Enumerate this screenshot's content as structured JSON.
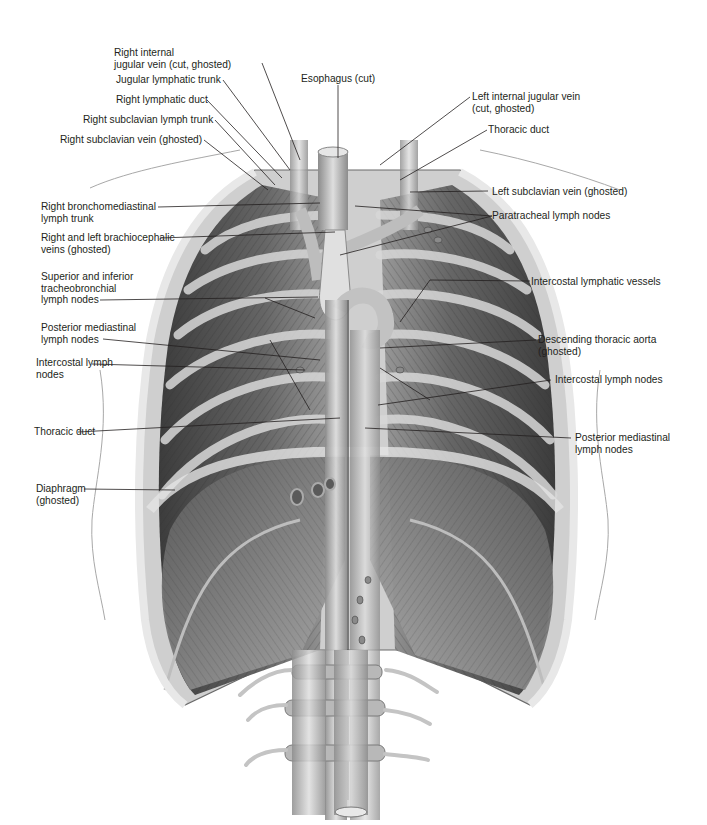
{
  "figure": {
    "colors": {
      "background": "#ffffff",
      "label_text": "#231f20",
      "leader_line": "#231f20",
      "tissue_dark": "#4a4a4a",
      "tissue_mid": "#8a8a8a",
      "tissue_light": "#cfcfcf",
      "outline": "#9a9a9a"
    }
  },
  "labels": {
    "left": [
      {
        "id": "rijv",
        "text": "Right internal\njugular vein (cut, ghosted)"
      },
      {
        "id": "jlt",
        "text": "Jugular lymphatic trunk"
      },
      {
        "id": "rld",
        "text": "Right lymphatic duct"
      },
      {
        "id": "rslt",
        "text": "Right subclavian lymph trunk"
      },
      {
        "id": "rsv",
        "text": "Right subclavian vein (ghosted)"
      },
      {
        "id": "rbmt",
        "text": "Right bronchomediastinal\nlymph trunk"
      },
      {
        "id": "rlbv",
        "text": "Right and left brachiocephalic\nveins (ghosted)"
      },
      {
        "id": "sitb",
        "text": "Superior and inferior\ntracheobronchial\nlymph nodes"
      },
      {
        "id": "pmln_l",
        "text": "Posterior mediastinal\nlymph nodes"
      },
      {
        "id": "icln_l",
        "text": "Intercostal lymph\nnodes"
      },
      {
        "id": "td_l",
        "text": "Thoracic duct"
      },
      {
        "id": "diaph",
        "text": "Diaphragm\n(ghosted)"
      }
    ],
    "top": [
      {
        "id": "eso",
        "text": "Esophagus (cut)"
      }
    ],
    "right": [
      {
        "id": "lijv",
        "text": "Left internal jugular vein\n(cut, ghosted)"
      },
      {
        "id": "td_r",
        "text": "Thoracic duct"
      },
      {
        "id": "lsv",
        "text": "Left subclavian vein (ghosted)"
      },
      {
        "id": "ptln",
        "text": "Paratracheal lymph nodes"
      },
      {
        "id": "iclv",
        "text": "Intercostal lymphatic vessels"
      },
      {
        "id": "dta",
        "text": "Descending thoracic aorta\n(ghosted)"
      },
      {
        "id": "icln_r",
        "text": "Intercostal lymph nodes"
      },
      {
        "id": "pmln_r",
        "text": "Posterior mediastinal\nlymph nodes"
      }
    ]
  }
}
